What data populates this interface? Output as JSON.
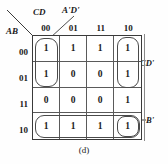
{
  "diagram": {
    "type": "karnaugh-map",
    "caption": "(d)",
    "axis": {
      "column_variable_label": "CD",
      "row_variable_label": "AB"
    },
    "column_headers": [
      "00",
      "01",
      "11",
      "10"
    ],
    "row_headers": [
      "00",
      "01",
      "11",
      "10"
    ],
    "cells": [
      [
        "1",
        "1",
        "1",
        "1"
      ],
      [
        "1",
        "0",
        "0",
        "1"
      ],
      [
        "0",
        "0",
        "0",
        "1"
      ],
      [
        "1",
        "1",
        "1",
        "1"
      ]
    ],
    "annotations": [
      {
        "id": "adp",
        "label": "A'D'"
      },
      {
        "id": "cdp",
        "label": "CD'"
      },
      {
        "id": "bp",
        "label": "B'"
      }
    ],
    "colors": {
      "ink": "#1a1a1a",
      "grid_line": "#5a5a5a",
      "group_outline": "#4a4a4a",
      "background": "#fefefe"
    }
  }
}
